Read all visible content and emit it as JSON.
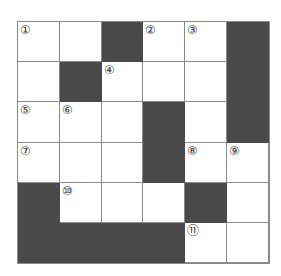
{
  "puzzle": {
    "rows": 6,
    "cols": 6,
    "colors": {
      "block": "#4a4a4a",
      "line": "#8a8a8a",
      "empty": "#ffffff"
    },
    "grid": [
      [
        {
          "n": "①"
        },
        {
          "n": ""
        },
        {
          "b": true
        },
        {
          "n": "②"
        },
        {
          "n": "③"
        },
        {
          "b": true
        }
      ],
      [
        {
          "n": ""
        },
        {
          "b": true
        },
        {
          "n": "④"
        },
        {
          "n": ""
        },
        {
          "n": ""
        },
        {
          "b": true
        }
      ],
      [
        {
          "n": "⑤"
        },
        {
          "n": "⑥"
        },
        {
          "n": ""
        },
        {
          "b": true
        },
        {
          "n": ""
        },
        {
          "b": true
        }
      ],
      [
        {
          "n": "⑦"
        },
        {
          "n": ""
        },
        {
          "n": ""
        },
        {
          "b": true
        },
        {
          "n": "⑧"
        },
        {
          "n": "⑨"
        }
      ],
      [
        {
          "b": true
        },
        {
          "n": "⑩"
        },
        {
          "n": ""
        },
        {
          "n": ""
        },
        {
          "b": true
        },
        {
          "n": ""
        }
      ],
      [
        {
          "b": true
        },
        {
          "b": true
        },
        {
          "b": true
        },
        {
          "b": true
        },
        {
          "n": "⑪"
        },
        {
          "n": ""
        }
      ]
    ]
  }
}
